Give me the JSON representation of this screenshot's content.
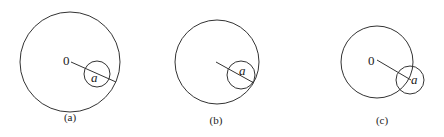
{
  "panels": [
    {
      "caption": "(a)",
      "center_label": "0",
      "small_label": "a",
      "big": {
        "cx": 70,
        "cy": 62,
        "r": 50
      },
      "small": {
        "cx": 97,
        "cy": 74,
        "r": 13
      },
      "line": {
        "x1": 71,
        "y1": 62,
        "x2": 116,
        "y2": 82
      },
      "center_label_pos": [
        63,
        65
      ],
      "small_label_pos": [
        91,
        82
      ],
      "caption_pos": [
        70,
        121
      ]
    },
    {
      "caption": "(b)",
      "center_label": "",
      "small_label": "a",
      "big": {
        "cx": 217,
        "cy": 62,
        "r": 42
      },
      "small": {
        "cx": 241,
        "cy": 75,
        "r": 14
      },
      "line": {
        "x1": 216,
        "y1": 62,
        "x2": 254,
        "y2": 83
      },
      "center_label_pos": [
        210,
        65
      ],
      "small_label_pos": [
        239,
        75
      ],
      "caption_pos": [
        216,
        124
      ]
    },
    {
      "caption": "(c)",
      "center_label": "0",
      "small_label": "a",
      "big": {
        "cx": 377,
        "cy": 62,
        "r": 36
      },
      "small": {
        "cx": 410,
        "cy": 80,
        "r": 14
      },
      "line": {
        "x1": 377,
        "y1": 60,
        "x2": 411,
        "y2": 80
      },
      "center_label_pos": [
        368,
        65
      ],
      "small_label_pos": [
        411,
        84
      ],
      "caption_pos": [
        382,
        124
      ]
    }
  ],
  "colors": {
    "stroke": "#333333",
    "background": "#ffffff"
  }
}
